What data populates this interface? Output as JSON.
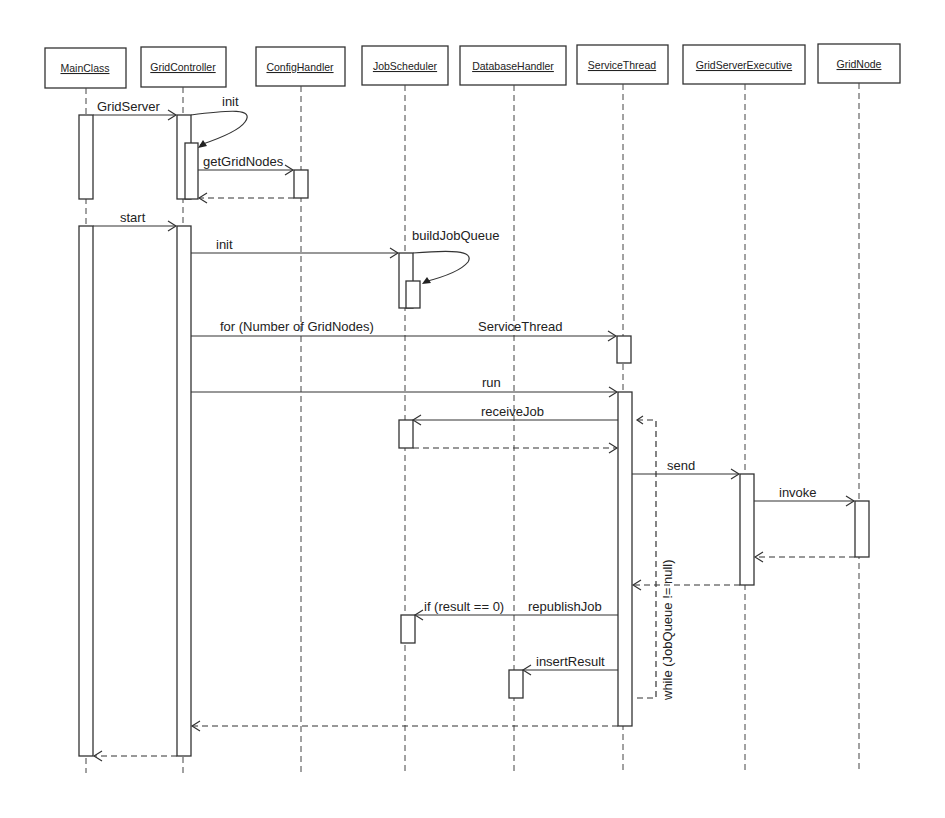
{
  "objects": [
    {
      "name": "MainClass",
      "x": 89
    },
    {
      "name": "GridController",
      "x": 184
    },
    {
      "name": "ConfigHandler",
      "x": 300
    },
    {
      "name": "JobScheduler",
      "x": 405
    },
    {
      "name": "DatabaseHandler",
      "x": 513
    },
    {
      "name": "ServiceThread",
      "x": 622
    },
    {
      "name": "GridServerExecutive",
      "x": 745
    },
    {
      "name": "GridNode",
      "x": 860
    }
  ],
  "messages": {
    "grid_server": "GridServer",
    "init_self": "init",
    "get_grid_nodes": "getGridNodes",
    "start": "start",
    "init_scheduler": "init",
    "build_job_queue": "buildJobQueue",
    "for_loop": "for (Number of GridNodes)",
    "service_thread": "ServiceThread",
    "run": "run",
    "receive_job": "receiveJob",
    "send": "send",
    "invoke": "invoke",
    "if_condition": "if (result == 0)",
    "republish_job": "republishJob",
    "insert_result": "insertResult",
    "while_loop": "while (JobQueue != null)"
  }
}
